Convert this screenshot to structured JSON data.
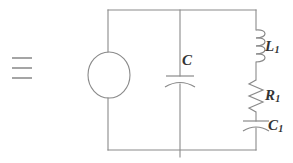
{
  "figure": {
    "type": "electrical-circuit-schematic",
    "title": "",
    "background_color": "#ffffff",
    "line_color": "#8a8a8a",
    "label_color": "#333333"
  },
  "annotation": {
    "equals_symbol": {
      "name": "triple-bar-symbol",
      "glyph": "≡",
      "bars": 3
    }
  },
  "components": [
    {
      "id": "source",
      "name": "voltage-source",
      "symbol": "circle",
      "label": "",
      "branch": "left",
      "cx": 109,
      "cy": 75,
      "rx": 21,
      "ry": 23
    },
    {
      "id": "C",
      "name": "capacitor-C",
      "symbol": "capacitor-curved",
      "label": "C",
      "subscript": "",
      "branch": "middle",
      "x": 180,
      "y": 78
    },
    {
      "id": "L1",
      "name": "inductor-L1",
      "symbol": "inductor-coil",
      "label": "L",
      "subscript": "1",
      "branch": "right",
      "x": 256,
      "y_top": 30,
      "y_bottom": 62,
      "coils": 4
    },
    {
      "id": "R1",
      "name": "resistor-R1",
      "symbol": "resistor-zigzag",
      "label": "R",
      "subscript": "1",
      "branch": "right",
      "x": 256,
      "y_top": 80,
      "y_bottom": 112,
      "peaks": 6
    },
    {
      "id": "C1",
      "name": "capacitor-C1",
      "symbol": "capacitor-curved",
      "label": "C",
      "subscript": "1",
      "branch": "right",
      "x": 256,
      "y": 124
    }
  ],
  "frame": {
    "name": "circuit-loop",
    "left": 108,
    "right": 256,
    "top": 10,
    "bottom": 150,
    "middle_branch_x": 180
  },
  "labels": {
    "C": {
      "text": "C",
      "sub": ""
    },
    "L1": {
      "text": "L",
      "sub": "1"
    },
    "R1": {
      "text": "R",
      "sub": "1"
    },
    "C1": {
      "text": "C",
      "sub": "1"
    }
  }
}
